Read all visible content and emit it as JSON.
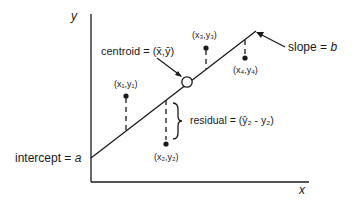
{
  "diagram": {
    "axes": {
      "x_label": "x",
      "y_label": "y"
    },
    "labels": {
      "centroid": "centroid = (x̄,ȳ)",
      "slope_prefix": "slope = ",
      "slope_var": "b",
      "intercept_prefix": "intercept = ",
      "intercept_var": "a",
      "residual": "residual = (ŷ₂ - y₂)"
    },
    "points": [
      {
        "label": "(x₁,y₁)"
      },
      {
        "label": "(x₂,y₂)"
      },
      {
        "label": "(x₃,y₃)"
      },
      {
        "label": "(x₄,y₄)"
      }
    ],
    "colors": {
      "ink": "#1a1a1a",
      "background": "#ffffff"
    }
  }
}
